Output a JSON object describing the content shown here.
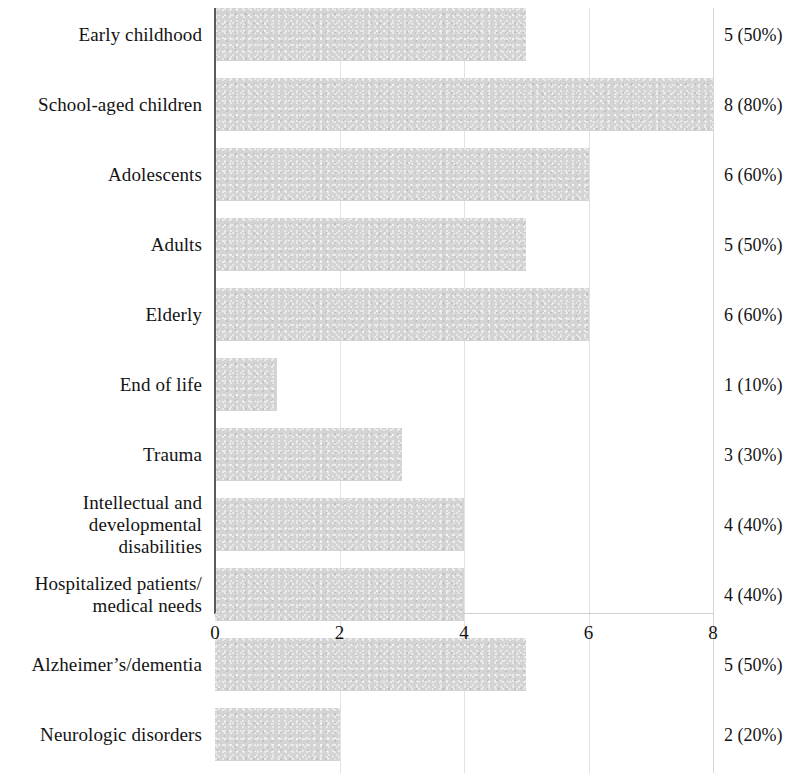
{
  "chart_data": {
    "type": "bar",
    "orientation": "horizontal",
    "title": "",
    "subtitle": "",
    "xlabel": "",
    "ylabel": "",
    "xlim": [
      0,
      8
    ],
    "xticks": [
      "0",
      "2",
      "4",
      "6",
      "8"
    ],
    "xtick_values": [
      0,
      2,
      4,
      6,
      8
    ],
    "grid": true,
    "grid_axis": "x",
    "legend": false,
    "legend_position": "none",
    "bar_color": "#d4d4d4",
    "axis_color": "#5c5c5c",
    "gridline_color": "#e2e2e2",
    "text_color": "#141414",
    "categories": [
      "Early childhood",
      "School-aged children",
      "Adolescents",
      "Adults",
      "Elderly",
      "End of life",
      "Trauma",
      "Intellectual and developmental disabilities",
      "Hospitalized patients/ medical needs",
      "Alzheimer’s/dementia",
      "Neurologic disorders"
    ],
    "values": [
      5,
      8,
      6,
      5,
      6,
      1,
      3,
      4,
      4,
      5,
      2
    ],
    "percents": [
      50,
      80,
      60,
      50,
      60,
      10,
      30,
      40,
      40,
      50,
      20
    ],
    "value_labels": [
      "5 (50%)",
      "8 (80%)",
      "6 (60%)",
      "5 (50%)",
      "6 (60%)",
      "1 (10%)",
      "3 (30%)",
      "4 (40%)",
      "4 (40%)",
      "5 (50%)",
      "2 (20%)"
    ]
  },
  "rows": [
    {
      "label_lines": [
        "Early childhood"
      ],
      "value": 5,
      "value_label": "5 (50%)"
    },
    {
      "label_lines": [
        "School-aged children"
      ],
      "value": 8,
      "value_label": "8 (80%)"
    },
    {
      "label_lines": [
        "Adolescents"
      ],
      "value": 6,
      "value_label": "6 (60%)"
    },
    {
      "label_lines": [
        "Adults"
      ],
      "value": 5,
      "value_label": "5 (50%)"
    },
    {
      "label_lines": [
        "Elderly"
      ],
      "value": 6,
      "value_label": "6 (60%)"
    },
    {
      "label_lines": [
        "End of life"
      ],
      "value": 1,
      "value_label": "1 (10%)"
    },
    {
      "label_lines": [
        "Trauma"
      ],
      "value": 3,
      "value_label": "3 (30%)"
    },
    {
      "label_lines": [
        "Intellectual and",
        "developmental",
        "disabilities"
      ],
      "value": 4,
      "value_label": "4 (40%)"
    },
    {
      "label_lines": [
        "Hospitalized patients/",
        "medical needs"
      ],
      "value": 4,
      "value_label": "4 (40%)"
    },
    {
      "label_lines": [
        "Alzheimer’s/dementia"
      ],
      "value": 5,
      "value_label": "5 (50%)"
    },
    {
      "label_lines": [
        "Neurologic disorders"
      ],
      "value": 2,
      "value_label": "2 (20%)"
    }
  ],
  "axis": {
    "ticks": [
      {
        "label": "0",
        "value": 0
      },
      {
        "label": "2",
        "value": 2
      },
      {
        "label": "4",
        "value": 4
      },
      {
        "label": "6",
        "value": 6
      },
      {
        "label": "8",
        "value": 8
      }
    ]
  }
}
